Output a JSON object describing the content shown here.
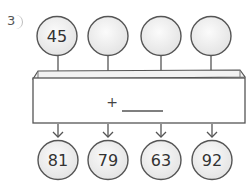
{
  "problem": {
    "number": "3",
    "suffix": ")"
  },
  "inputs": [
    {
      "value": "45"
    },
    {
      "value": ""
    },
    {
      "value": ""
    },
    {
      "value": ""
    }
  ],
  "machine": {
    "operator": "+",
    "operand_blank": ""
  },
  "outputs": [
    {
      "value": "81"
    },
    {
      "value": "79"
    },
    {
      "value": "63"
    },
    {
      "value": "92"
    }
  ],
  "colors": {
    "stroke": "#555555",
    "circle_fill": "#ededed",
    "box_fill": "#ffffff",
    "box_top": "#f2f2f2",
    "text": "#333333"
  }
}
